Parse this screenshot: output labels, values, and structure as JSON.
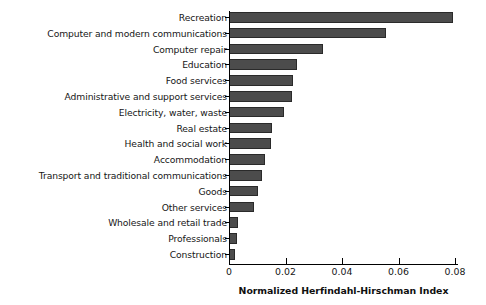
{
  "chart_data": {
    "type": "bar",
    "orientation": "horizontal",
    "title": "",
    "xlabel": "Normalized Herfindahl-Hirschman Index",
    "ylabel": "",
    "xlim": [
      0,
      0.08
    ],
    "xticks": [
      0,
      0.02,
      0.04,
      0.06,
      0.08
    ],
    "xtick_labels": [
      "0",
      "0.02",
      "0.04",
      "0.06",
      "0.08"
    ],
    "grid": false,
    "legend": null,
    "bar_color": "#4c4c4c",
    "bar_edge_color": "#2a2a2a",
    "categories": [
      "Recreation",
      "Computer and modern communications",
      "Computer repair",
      "Education",
      "Food services",
      "Administrative and support services",
      "Electricity, water, waste",
      "Real estate",
      "Health and social work",
      "Accommodation",
      "Transport and traditional communications",
      "Goods",
      "Other services",
      "Wholesale and retail trade",
      "Professionals",
      "Construction"
    ],
    "values": [
      0.0789,
      0.0552,
      0.0329,
      0.0237,
      0.0223,
      0.0219,
      0.0191,
      0.0149,
      0.0145,
      0.0124,
      0.0113,
      0.0099,
      0.0085,
      0.0028,
      0.0025,
      0.0018
    ]
  }
}
